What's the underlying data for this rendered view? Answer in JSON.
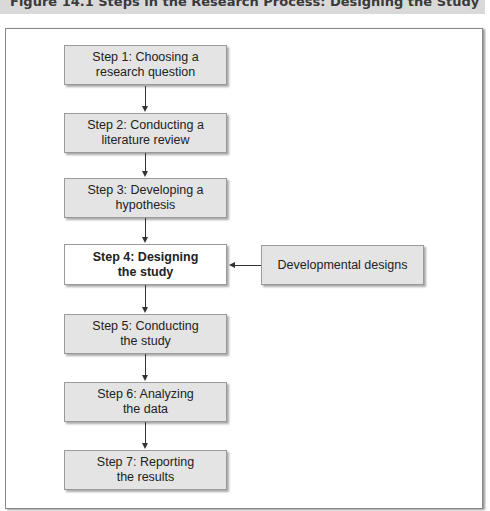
{
  "figure": {
    "caption": "Figure 14.1   Steps in the Research Process: Designing the Study"
  },
  "steps": [
    {
      "line1": "Step 1: Choosing a",
      "line2": "research question"
    },
    {
      "line1": "Step 2: Conducting a",
      "line2": "literature review"
    },
    {
      "line1": "Step 3: Developing a",
      "line2": "hypothesis"
    },
    {
      "line1": "Step 4: Designing",
      "line2": "the study",
      "highlighted": true
    },
    {
      "line1": "Step 5: Conducting",
      "line2": "the study"
    },
    {
      "line1": "Step 6: Analyzing",
      "line2": "the data"
    },
    {
      "line1": "Step 7: Reporting",
      "line2": "the results"
    }
  ],
  "side_box": {
    "label": "Developmental designs",
    "points_to_step": 4
  }
}
